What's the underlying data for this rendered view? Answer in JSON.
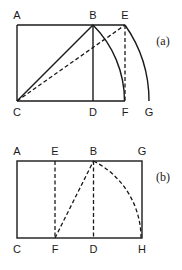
{
  "figure_a": {
    "caption": "(a)",
    "points": {
      "A": "A",
      "B": "B",
      "E": "E",
      "C": "C",
      "D": "D",
      "F": "F",
      "G": "G"
    }
  },
  "figure_b": {
    "caption": "(b)",
    "points": {
      "A": "A",
      "E": "E",
      "B": "B",
      "G": "G",
      "C": "C",
      "F": "F",
      "D": "D",
      "H": "H"
    }
  },
  "colors": {
    "ink": "#1a1a1a",
    "background": "#ffffff"
  }
}
